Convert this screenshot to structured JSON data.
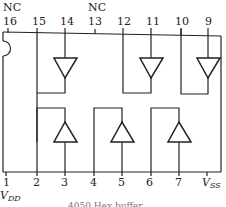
{
  "diagram": {
    "caption": "4050 Hex buffer",
    "top_nc_labels": [
      {
        "pin": "16",
        "label": "NC"
      },
      {
        "pin": "13",
        "label": "NC"
      }
    ],
    "top_pins": [
      "16",
      "15",
      "14",
      "13",
      "12",
      "11",
      "10",
      "9"
    ],
    "bottom_pins": [
      "1",
      "2",
      "3",
      "4",
      "5",
      "6",
      "7"
    ],
    "vdd_label": "V",
    "vdd_sub": "DD",
    "vss_label": "V",
    "vss_sub": "SS",
    "buffers": [
      {
        "input": "15",
        "output": "14",
        "row": "top"
      },
      {
        "input": "12",
        "output": "11",
        "row": "top"
      },
      {
        "input": "10",
        "output": "9",
        "row": "top"
      },
      {
        "input": "3",
        "output": "2",
        "row": "bottom"
      },
      {
        "input": "5",
        "output": "4",
        "row": "bottom"
      },
      {
        "input": "7",
        "output": "6",
        "row": "bottom"
      }
    ]
  }
}
